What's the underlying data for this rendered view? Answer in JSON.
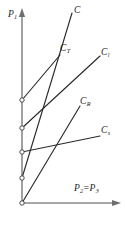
{
  "figure": {
    "background_color": "#ffffff",
    "line_color": "#2b2b2b",
    "axis_color": "#8a8a8a"
  },
  "axes": {
    "y_axis": {
      "name": "P1",
      "label_base": "P",
      "label_sub": "1",
      "x_px": 22,
      "top_px": 12,
      "bottom_px": 203
    },
    "x_axis": {
      "name": "P2=P3",
      "label_base_a": "P",
      "label_sub_a": "2",
      "equals": "=",
      "label_base_b": "P",
      "label_sub_b": "3",
      "y_px": 203,
      "left_px": 22,
      "right_px": 120
    }
  },
  "chart_data": {
    "type": "line",
    "xlabel": "P2=P3",
    "ylabel": "P1",
    "grid": false,
    "legend": "inline-end-labels",
    "axis_origin_px": [
      22,
      203
    ],
    "xlim_px": [
      22,
      120
    ],
    "ylim_px": [
      203,
      12
    ],
    "series": [
      {
        "name": "C",
        "label": "C",
        "label_base": "C",
        "label_sub": "",
        "points_px": [
          [
            22,
            178
          ],
          [
            72,
            13
          ]
        ],
        "y_intercept_marker": true,
        "label_pos_px": [
          74,
          6
        ]
      },
      {
        "name": "C_T",
        "label": "CT",
        "label_base": "C",
        "label_sub": "T",
        "points_px": [
          [
            22,
            100
          ],
          [
            60,
            55
          ]
        ],
        "y_intercept_marker": true,
        "label_pos_px": [
          60,
          44
        ]
      },
      {
        "name": "C_l",
        "label": "Cl",
        "label_base": "C",
        "label_sub": "l",
        "points_px": [
          [
            22,
            128
          ],
          [
            100,
            56
          ]
        ],
        "y_intercept_marker": true,
        "label_pos_px": [
          101,
          48
        ]
      },
      {
        "name": "C_R",
        "label": "CR",
        "label_base": "C",
        "label_sub": "R",
        "points_px": [
          [
            22,
            203
          ],
          [
            80,
            106
          ]
        ],
        "y_intercept_marker": true,
        "label_pos_px": [
          80,
          97
        ]
      },
      {
        "name": "C_s",
        "label": "Cs",
        "label_base": "C",
        "label_sub": "s",
        "points_px": [
          [
            22,
            152
          ],
          [
            100,
            136
          ]
        ],
        "y_intercept_marker": true,
        "label_pos_px": [
          101,
          126
        ]
      }
    ],
    "y_intercept_markers_px": [
      [
        22,
        100
      ],
      [
        22,
        128
      ],
      [
        22,
        152
      ],
      [
        22,
        178
      ],
      [
        22,
        203
      ]
    ]
  }
}
